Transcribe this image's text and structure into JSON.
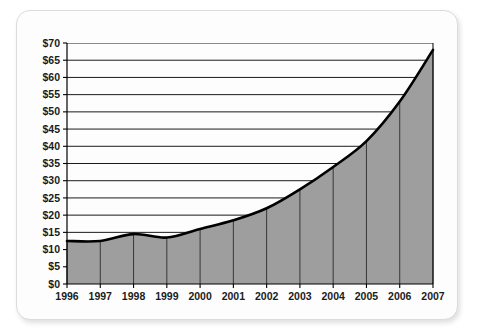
{
  "chart_data": {
    "type": "area",
    "title": "",
    "subtitle": "",
    "xlabel": "",
    "ylabel": "",
    "categories": [
      "1996",
      "1997",
      "1998",
      "1999",
      "2000",
      "2001",
      "2002",
      "2003",
      "2004",
      "2005",
      "2006",
      "2007"
    ],
    "values": [
      12.5,
      12.5,
      14.5,
      13.5,
      16,
      18.5,
      22,
      27.5,
      34,
      41.5,
      53,
      68
    ],
    "series": [
      {
        "name": "",
        "values": [
          12.5,
          12.5,
          14.5,
          13.5,
          16,
          18.5,
          22,
          27.5,
          34,
          41.5,
          53,
          68
        ]
      }
    ],
    "ylim": [
      0,
      70
    ],
    "ytick_values": [
      0,
      5,
      10,
      15,
      20,
      25,
      30,
      35,
      40,
      45,
      50,
      55,
      60,
      65,
      70
    ],
    "ytick_labels": [
      "$0",
      "$5",
      "$10",
      "$15",
      "$20",
      "$25",
      "$30",
      "$35",
      "$40",
      "$45",
      "$50",
      "$55",
      "$60",
      "$65",
      "$70"
    ],
    "xtick_labels": [
      "1996",
      "1997",
      "1998",
      "1999",
      "2000",
      "2001",
      "2002",
      "2003",
      "2004",
      "2005",
      "2006",
      "2007"
    ],
    "grid": true,
    "grid_orientation": "horizontal",
    "legend": false,
    "legend_position": "none",
    "annotations": [],
    "colors": {
      "area_fill": "#9e9e9e",
      "line": "#000000",
      "gridline": "#000000",
      "axis": "#000000",
      "card_background": "#fdfdfd",
      "page_background": "#ffffff",
      "tick_text": "#1b1b1b"
    }
  }
}
